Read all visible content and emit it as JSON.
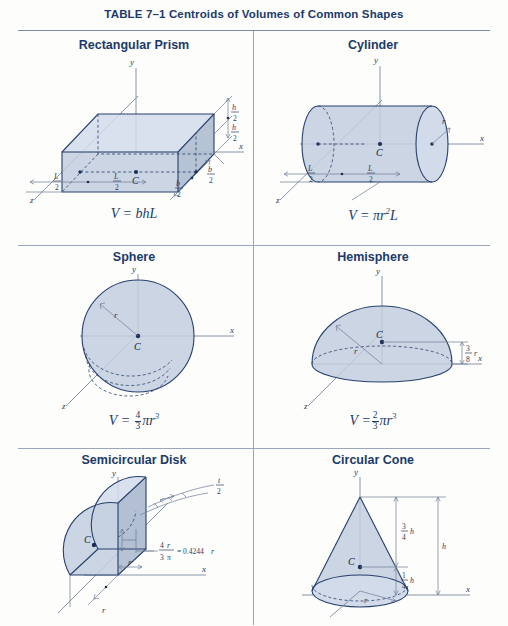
{
  "table": {
    "title": "TABLE 7–1 Centroids of Volumes of Common Shapes",
    "accent_color": "#1b3a6b",
    "shape_fill": "#c2cede",
    "rule_color": "#9aa6bb"
  },
  "cells": [
    {
      "id": "rectangular-prism",
      "title": "Rectangular Prism",
      "volume_formula": "V = bhL",
      "centroid_label": "C",
      "axes": [
        "x",
        "y",
        "z"
      ],
      "dimension_labels": [
        {
          "text": "h/2",
          "num": "h",
          "den": "2"
        },
        {
          "text": "h/2",
          "num": "h",
          "den": "2"
        },
        {
          "text": "L/2",
          "num": "L",
          "den": "2"
        },
        {
          "text": "L/2",
          "num": "L",
          "den": "2"
        },
        {
          "text": "b/2",
          "num": "b",
          "den": "2"
        },
        {
          "text": "b/2",
          "num": "b",
          "den": "2"
        }
      ]
    },
    {
      "id": "cylinder",
      "title": "Cylinder",
      "volume_formula": "V = πr²L",
      "centroid_label": "C",
      "axes": [
        "x",
        "y",
        "z"
      ],
      "dimension_labels": [
        {
          "text": "L/2",
          "num": "L",
          "den": "2"
        },
        {
          "text": "L/2",
          "num": "L",
          "den": "2"
        },
        {
          "text": "r"
        }
      ]
    },
    {
      "id": "sphere",
      "title": "Sphere",
      "volume_formula": "V = 4/3 πr³",
      "centroid_label": "C",
      "axes": [
        "x",
        "y",
        "z"
      ],
      "dimension_labels": [
        {
          "text": "r"
        }
      ]
    },
    {
      "id": "hemisphere",
      "title": "Hemisphere",
      "volume_formula": "V = 2/3 πr³",
      "centroid_label": "C",
      "axes": [
        "x",
        "y",
        "z"
      ],
      "dimension_labels": [
        {
          "text": "r"
        },
        {
          "text": "3/8 r",
          "num": "3",
          "den": "8",
          "suffix": "r"
        }
      ]
    },
    {
      "id": "semicircular-disk",
      "title": "Semicircular Disk",
      "volume_formula": "",
      "centroid_label": "C",
      "axes": [
        "x",
        "y"
      ],
      "dimension_labels": [
        {
          "text": "t/2",
          "num": "t",
          "den": "2"
        },
        {
          "text": "r"
        },
        {
          "text": "r"
        }
      ],
      "annotation": {
        "num": "4r",
        "den": "3π",
        "equals": "= 0.4244r"
      }
    },
    {
      "id": "circular-cone",
      "title": "Circular Cone",
      "volume_formula": "",
      "centroid_label": "C",
      "axes": [
        "x",
        "y"
      ],
      "dimension_labels": [
        {
          "text": "3/4 h",
          "num": "3",
          "den": "4",
          "suffix": "h"
        },
        {
          "text": "1/4 h",
          "num": "1",
          "den": "4",
          "suffix": "h"
        },
        {
          "text": "h"
        },
        {
          "text": "r"
        }
      ]
    }
  ],
  "formulas": {
    "prism": {
      "lead": "V = ",
      "body": "bhL"
    },
    "cylinder": {
      "lead": "V = ",
      "pi": "π",
      "r": "r",
      "exp": "2",
      "tail": "L"
    },
    "sphere": {
      "lead": "V = ",
      "num": "4",
      "den": "3",
      "pi": "π",
      "r": "r",
      "exp": "3"
    },
    "hemisphere": {
      "lead": "V =",
      "num": "2",
      "den": "3",
      "pi": "π",
      "r": "r",
      "exp": "3"
    }
  }
}
